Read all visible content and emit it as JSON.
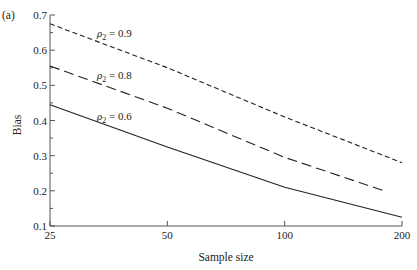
{
  "panel_label": "(a)",
  "chart_data": {
    "type": "line",
    "title": "",
    "xlabel": "Sample size",
    "ylabel": "Bias",
    "x_scale": "log",
    "x": [
      25,
      50,
      100,
      200
    ],
    "x_ticks": [
      "25",
      "50",
      "100",
      "200"
    ],
    "ylim": [
      0.1,
      0.7
    ],
    "y_ticks": [
      "0.1",
      "0.2",
      "0.3",
      "0.4",
      "0.5",
      "0.6",
      "0.7"
    ],
    "y_minor_step": 0.05,
    "grid": false,
    "legend": "inline annotations",
    "series": [
      {
        "name": "ρ2 = 0.9",
        "label_symbol": "ρ",
        "label_sub": "2",
        "label_value": " = 0.9",
        "style": "short-dash",
        "x": [
          25,
          50,
          100,
          200
        ],
        "values": [
          0.675,
          0.55,
          0.41,
          0.28
        ]
      },
      {
        "name": "ρ2 = 0.8",
        "label_symbol": "ρ",
        "label_sub": "2",
        "label_value": " = 0.8",
        "style": "long-dash",
        "x": [
          25,
          50,
          100,
          180
        ],
        "values": [
          0.555,
          0.435,
          0.295,
          0.2
        ]
      },
      {
        "name": "ρ2 = 0.6",
        "label_symbol": "ρ",
        "label_sub": "2",
        "label_value": " = 0.6",
        "style": "solid",
        "x": [
          25,
          50,
          100,
          200
        ],
        "values": [
          0.445,
          0.325,
          0.21,
          0.125
        ]
      }
    ]
  }
}
